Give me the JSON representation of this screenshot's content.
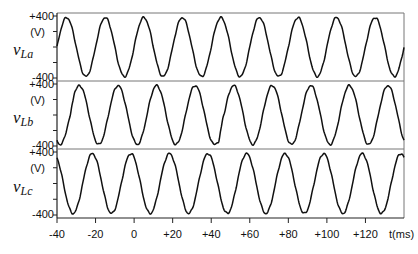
{
  "chart_data": {
    "type": "line",
    "title": "",
    "xlabel": "t(ms)",
    "x_range": [
      -40,
      140
    ],
    "x_ticks": [
      -40,
      -20,
      0,
      20,
      40,
      60,
      80,
      100,
      120
    ],
    "x_tick_labels": [
      "-40",
      "-20",
      "0",
      "+20",
      "+40",
      "+60",
      "+80",
      "+100",
      "+120"
    ],
    "frequency_hz": 50,
    "amplitude_v": 380,
    "panels": [
      {
        "name": "vLa",
        "ylabel_main": "v",
        "ylabel_sub": "La",
        "unit": "(V)",
        "ylim": [
          -400,
          400
        ],
        "y_tick_labels": [
          "+400",
          "-400"
        ],
        "phase_deg": 0,
        "disturbances": []
      },
      {
        "name": "vLb",
        "ylabel_main": "v",
        "ylabel_sub": "Lb",
        "unit": "(V)",
        "ylim": [
          -400,
          400
        ],
        "y_tick_labels": [
          "+400",
          "-400"
        ],
        "phase_deg": -120,
        "disturbances": [
          {
            "t_ms": -33,
            "delta_v": -40
          },
          {
            "t_ms": -31,
            "delta_v": 30
          },
          {
            "t_ms": 44,
            "delta_v": -60
          },
          {
            "t_ms": 46,
            "delta_v": 40
          }
        ]
      },
      {
        "name": "vLc",
        "ylabel_main": "v",
        "ylabel_sub": "Lc",
        "unit": "(V)",
        "ylim": [
          -400,
          400
        ],
        "y_tick_labels": [
          "+400",
          "-400"
        ],
        "phase_deg": 120,
        "disturbances": []
      }
    ],
    "grid": false,
    "legend": "none"
  },
  "colors": {
    "trace": "#111111",
    "axis": "#222222",
    "divider": "#777777"
  }
}
